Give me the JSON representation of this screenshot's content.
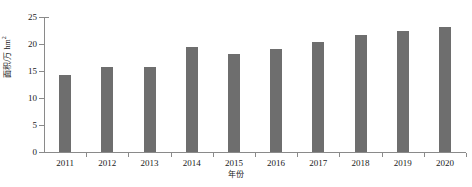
{
  "chart_data": {
    "type": "bar",
    "title": "",
    "xlabel": "年份",
    "ylabel": "面积/万 hm",
    "ylabel_superscript": "2",
    "categories": [
      "2011",
      "2012",
      "2013",
      "2014",
      "2015",
      "2016",
      "2017",
      "2018",
      "2019",
      "2020"
    ],
    "values": [
      14.3,
      15.8,
      15.7,
      19.4,
      18.2,
      19.0,
      20.4,
      21.6,
      22.5,
      23.1
    ],
    "ylim": [
      0,
      25
    ],
    "yticks": [
      "0",
      "5",
      "10",
      "15",
      "20",
      "25"
    ],
    "ytick_values": [
      0,
      5,
      10,
      15,
      20,
      25
    ],
    "grid": false,
    "legend": false,
    "bar_color": "#6e6e6e",
    "axis_color": "#8a8a8a",
    "background": "#ffffff"
  }
}
